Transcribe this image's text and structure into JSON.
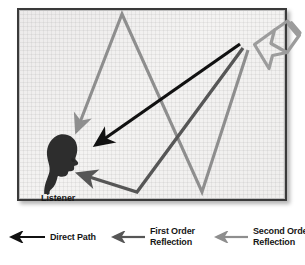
{
  "diagram": {
    "listener": {
      "label": "Listener",
      "icon": "listener-head-icon",
      "position": {
        "x": 46,
        "y": 154
      }
    },
    "source": {
      "label": "",
      "icon": "loudspeaker-horn-icon",
      "position": {
        "x": 255,
        "y": 35
      }
    },
    "colors": {
      "direct_path": "#111111",
      "first_order": "#565656",
      "second_order": "#8e8e8e",
      "frame_border": "#3a3a3a",
      "background": "#f1f0ef",
      "listener_fill": "#2e2e2e",
      "speaker_outline": "#9a9a9a"
    },
    "paths": [
      {
        "name": "direct-path-ray",
        "kind": "direct",
        "color": "#111111",
        "points": [
          [
            221,
            34
          ],
          [
            78,
            134
          ]
        ]
      },
      {
        "name": "first-order-reflection-ray",
        "kind": "first_order",
        "color": "#565656",
        "points": [
          [
            224,
            38
          ],
          [
            118,
            182
          ],
          [
            61,
            164
          ]
        ]
      },
      {
        "name": "second-order-reflection-ray",
        "kind": "second_order",
        "color": "#8e8e8e",
        "points": [
          [
            229,
            40
          ],
          [
            183,
            182
          ],
          [
            103,
            4
          ],
          [
            58,
            120
          ]
        ]
      }
    ]
  },
  "legend": {
    "items": [
      {
        "name": "legend-direct-path",
        "label": "Direct Path",
        "label_lines": [
          "Direct Path"
        ],
        "color": "#111111"
      },
      {
        "name": "legend-first-order-reflection",
        "label": "First Order Reflection",
        "label_lines": [
          "First Order",
          "Reflection"
        ],
        "color": "#565656"
      },
      {
        "name": "legend-second-order-reflection",
        "label": "Second Order Reflection",
        "label_lines": [
          "Second Order",
          "Reflection"
        ],
        "color": "#8e8e8e"
      }
    ]
  }
}
